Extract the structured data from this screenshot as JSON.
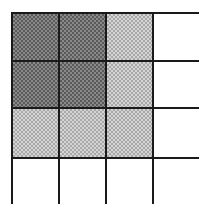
{
  "diagram": {
    "type": "grid",
    "rows": 4,
    "columns": 4,
    "colors": {
      "dark": "#8a8a8a",
      "light": "#d4d4d4",
      "white": "#ffffff",
      "border": "#1a1a1a"
    },
    "cells": [
      [
        "dark",
        "dark",
        "light",
        "white"
      ],
      [
        "dark",
        "dark",
        "light",
        "white"
      ],
      [
        "light",
        "light",
        "light",
        "white"
      ],
      [
        "white",
        "white",
        "white",
        "white"
      ]
    ],
    "region_counts": {
      "dark": 4,
      "light": 5,
      "white": 7
    }
  }
}
